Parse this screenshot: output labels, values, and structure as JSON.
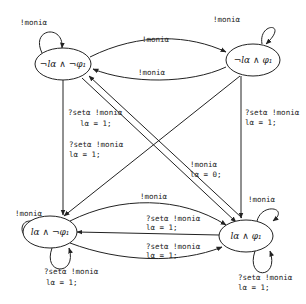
{
  "diagram": {
    "type": "state-machine",
    "colors": {
      "stroke": "#222222",
      "background": "#ffffff"
    },
    "states": [
      {
        "id": "s1",
        "label": "¬l_α ∧ ¬φ1",
        "display": "¬lα ∧ ¬φ₁"
      },
      {
        "id": "s2",
        "label": "¬l_α ∧ φ1",
        "display": "¬lα ∧ φ₁"
      },
      {
        "id": "s3",
        "label": "l_α ∧ ¬φ1",
        "display": "lα ∧ ¬φ₁"
      },
      {
        "id": "s4",
        "label": "l_α ∧ φ1",
        "display": "lα ∧ φ₁"
      }
    ],
    "transitions": [
      {
        "from": "s1",
        "to": "s1",
        "label": "!moni_α",
        "display": [
          "!moniα"
        ]
      },
      {
        "from": "s1",
        "to": "s2",
        "label": "!moni_α",
        "display": [
          "!moniα"
        ]
      },
      {
        "from": "s2",
        "to": "s1",
        "label": "!moni_α",
        "display": [
          "!moniα"
        ]
      },
      {
        "from": "s2",
        "to": "s2",
        "label": "!moni_α",
        "display": [
          "!moniα"
        ]
      },
      {
        "from": "s1",
        "to": "s3",
        "label": "?set_α !moni_α l_α = 1;",
        "display": [
          "?setα !moniα",
          "lα = 1;"
        ]
      },
      {
        "from": "s2",
        "to": "s3",
        "label": "?set_α !moni_α l_α = 1;",
        "display": [
          "?setα !moniα",
          "lα = 1;"
        ]
      },
      {
        "from": "s1",
        "to": "s4",
        "label": "?set_α !moni_α l_α = 1;",
        "display": [
          "?setα !moniα",
          "lα = 1;"
        ]
      },
      {
        "from": "s4",
        "to": "s1",
        "label": "!moni_α l_α = 0;",
        "display": [
          "!moniα",
          "lα = 0;"
        ]
      },
      {
        "from": "s2",
        "to": "s4",
        "label": "?set_α !moni_α l_α = 1;",
        "display": [
          "?setα !moniα",
          "lα = 1;"
        ]
      },
      {
        "from": "s3",
        "to": "s4",
        "label": "?set_α !moni_α l_α = 1;",
        "display": [
          "?setα !moniα",
          "lα = 1;"
        ]
      },
      {
        "from": "s4",
        "to": "s3",
        "label": "!moni_α",
        "display": [
          "!moniα"
        ]
      },
      {
        "from": "s3",
        "to": "s4",
        "label": "?set_α !moni_α l_α = 1;",
        "display": [
          "?setα !moniα",
          "lα = 1;"
        ]
      },
      {
        "from": "s3",
        "to": "s3",
        "label": "!moni_α",
        "display": [
          "!moniα"
        ]
      },
      {
        "from": "s3",
        "to": "s3",
        "label": "?set_α !moni_α l_α = 1;",
        "display": [
          "?setα !moniα",
          "lα = 1;"
        ]
      },
      {
        "from": "s4",
        "to": "s4",
        "label": "!moni_α",
        "display": [
          "!moniα"
        ]
      },
      {
        "from": "s4",
        "to": "s4",
        "label": "?set_α !moni_α l_α = 1;",
        "display": [
          "?setα !moniα",
          "lα = 1;"
        ]
      }
    ]
  },
  "labels": {
    "s1": "¬lα ∧ ¬φ₁",
    "s2": "¬lα ∧ φ₁",
    "s3": "lα ∧ ¬φ₁",
    "s4": "lα ∧ φ₁",
    "moni": "!moniα",
    "set_moni": "?setα !moniα",
    "assign1": "lα = 1;",
    "assign0": "lα = 0;"
  }
}
